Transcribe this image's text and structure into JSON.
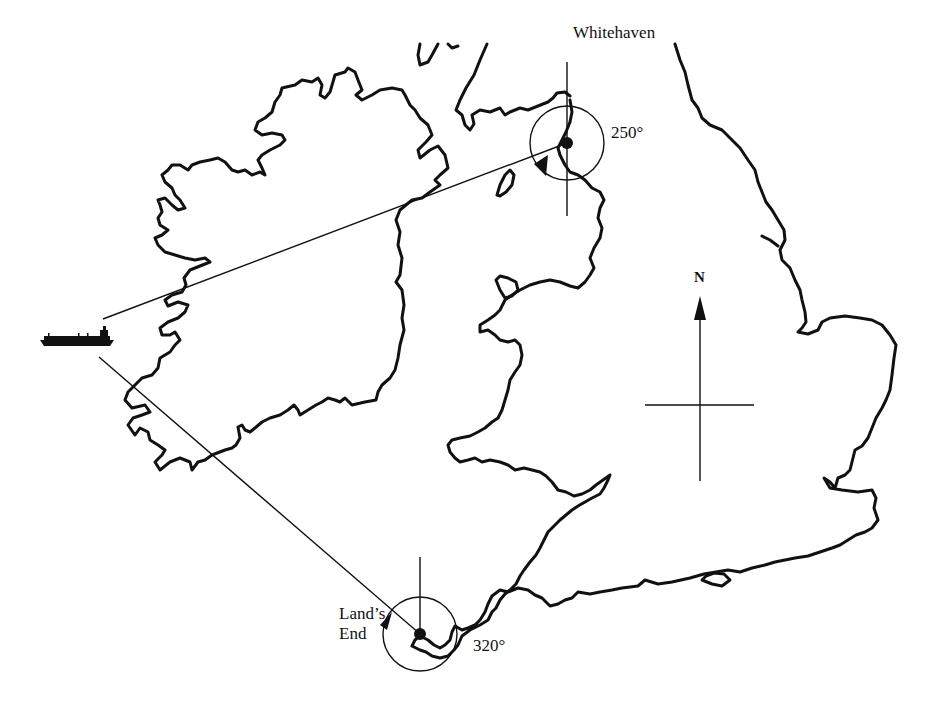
{
  "diagram": {
    "type": "navigation-bearing-fix",
    "stations": [
      {
        "name": "Whitehaven",
        "bearing_label": "250°"
      },
      {
        "name_line1": "Land’s",
        "name_line2": "End",
        "bearing_label": "320°"
      }
    ],
    "north_label": "N",
    "ship": "ship-icon",
    "regions": [
      "ireland-coastline",
      "great-britain-coastline",
      "isle-of-man",
      "anglesey",
      "isle-of-wight"
    ],
    "colors": {
      "ink": "#111111",
      "background": "#ffffff"
    }
  }
}
